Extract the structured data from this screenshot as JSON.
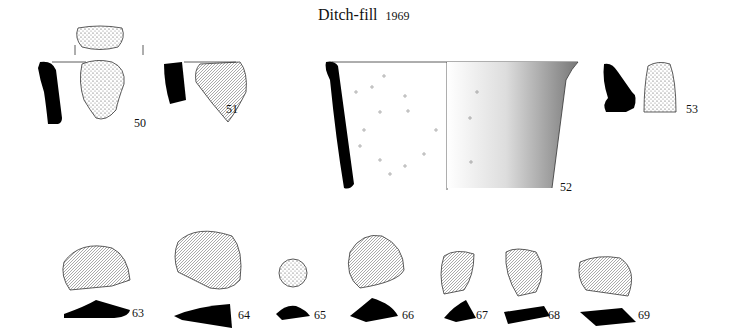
{
  "title": {
    "text": "Ditch-fill",
    "year": "1969"
  },
  "pottery": [
    {
      "id": "50",
      "label": "50"
    },
    {
      "id": "51",
      "label": "51"
    },
    {
      "id": "52",
      "label": "52"
    },
    {
      "id": "53",
      "label": "53"
    }
  ],
  "flints": [
    {
      "id": "63",
      "label": "63"
    },
    {
      "id": "64",
      "label": "64"
    },
    {
      "id": "65",
      "label": "65"
    },
    {
      "id": "66",
      "label": "66"
    },
    {
      "id": "67",
      "label": "67"
    },
    {
      "id": "68",
      "label": "68"
    },
    {
      "id": "69",
      "label": "69"
    }
  ]
}
